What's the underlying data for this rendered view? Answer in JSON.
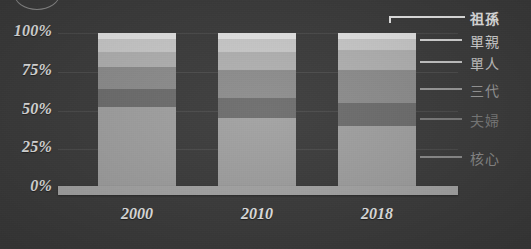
{
  "background_color": "#3c3c3c",
  "decor": {
    "corner_circle_name": "circle-outline"
  },
  "chart_data": {
    "type": "bar",
    "subtype": "stacked-percentage",
    "title": "",
    "xlabel": "",
    "ylabel": "",
    "ylim": [
      0,
      100
    ],
    "grid": true,
    "legend_position": "right",
    "categories": [
      "2000",
      "2010",
      "2018"
    ],
    "ytick_labels": [
      "100%",
      "75%",
      "50%",
      "25%",
      "0%"
    ],
    "ytick_values": [
      100,
      75,
      50,
      25,
      0
    ],
    "series": [
      {
        "name": "核心",
        "color": "#a3a3a3",
        "values": [
          52,
          45,
          40
        ]
      },
      {
        "name": "夫婦",
        "color": "#6e6e6e",
        "values": [
          12,
          13,
          15
        ]
      },
      {
        "name": "三代",
        "color": "#8f8f8f",
        "values": [
          14,
          18,
          21
        ]
      },
      {
        "name": "單人",
        "color": "#b5b5b5",
        "values": [
          10,
          12,
          13
        ]
      },
      {
        "name": "單親",
        "color": "#cfcfcf",
        "values": [
          8,
          8,
          7
        ]
      },
      {
        "name": "祖孫",
        "color": "#ebebeb",
        "values": [
          4,
          4,
          4
        ]
      }
    ],
    "legend_entries": [
      {
        "label": "祖孫",
        "color": "#efefef",
        "bold": true,
        "bracket": true
      },
      {
        "label": "單親",
        "color": "#dcdcdc",
        "bold": false,
        "bracket": false
      },
      {
        "label": "單人",
        "color": "#cacaca",
        "bold": false,
        "bracket": false
      },
      {
        "label": "三代",
        "color": "#9d9d9d",
        "bold": false,
        "bracket": false
      },
      {
        "label": "夫婦",
        "color": "#7d7d7d",
        "bold": false,
        "bracket": false
      },
      {
        "label": "核心",
        "color": "#8e8e8e",
        "bold": false,
        "bracket": false
      }
    ]
  }
}
